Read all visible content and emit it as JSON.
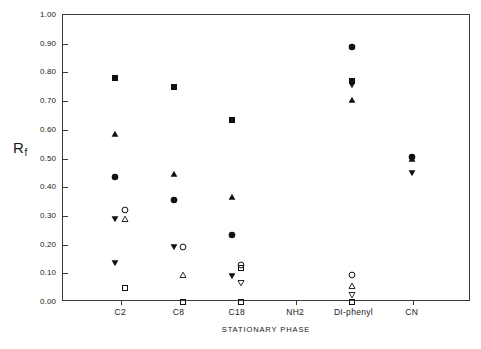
{
  "chart_data": {
    "type": "scatter",
    "title": "",
    "xlabel": "STATIONARY PHASE",
    "ylabel": "Rf",
    "ylabel_base": "R",
    "ylabel_sub": "f",
    "categories": [
      "C2",
      "C8",
      "C18",
      "NH2",
      "DI-phenyl",
      "CN"
    ],
    "ylim": [
      0.0,
      1.0
    ],
    "yticks": [
      "0.00",
      "0.10",
      "0.20",
      "0.30",
      "0.40",
      "0.50",
      "0.60",
      "0.70",
      "0.80",
      "0.90",
      "1.00"
    ],
    "ytick_values": [
      0.0,
      0.1,
      0.2,
      0.3,
      0.4,
      0.5,
      0.6,
      0.7,
      0.8,
      0.9,
      1.0
    ],
    "grid": false,
    "legend": "none",
    "marker_color": "#111111",
    "axis_color": "#3a3a3a",
    "series": [
      {
        "name": "filled-square",
        "marker": "filled-square",
        "points": [
          {
            "category": "C2",
            "offset": -0.1,
            "value": 0.78
          },
          {
            "category": "C8",
            "offset": -0.1,
            "value": 0.75
          },
          {
            "category": "C18",
            "offset": -0.1,
            "value": 0.635
          },
          {
            "category": "DI-phenyl",
            "offset": -0.04,
            "value": 0.77
          }
        ]
      },
      {
        "name": "filled-up-triangle",
        "marker": "filled-up-triangle",
        "points": [
          {
            "category": "C2",
            "offset": -0.1,
            "value": 0.585
          },
          {
            "category": "C8",
            "offset": -0.1,
            "value": 0.445
          },
          {
            "category": "C18",
            "offset": -0.1,
            "value": 0.365
          },
          {
            "category": "DI-phenyl",
            "offset": -0.04,
            "value": 0.705
          },
          {
            "category": "CN",
            "offset": -0.02,
            "value": 0.5
          }
        ]
      },
      {
        "name": "filled-circle",
        "marker": "filled-circle",
        "points": [
          {
            "category": "C2",
            "offset": -0.1,
            "value": 0.435
          },
          {
            "category": "C8",
            "offset": -0.1,
            "value": 0.355
          },
          {
            "category": "C18",
            "offset": -0.1,
            "value": 0.235
          },
          {
            "category": "DI-phenyl",
            "offset": -0.04,
            "value": 0.89
          },
          {
            "category": "CN",
            "offset": -0.02,
            "value": 0.505
          }
        ]
      },
      {
        "name": "filled-down-triangle",
        "marker": "filled-down-triangle",
        "points": [
          {
            "category": "C2",
            "offset": -0.1,
            "value": 0.29
          },
          {
            "category": "C2",
            "offset": -0.1,
            "value": 0.135
          },
          {
            "category": "C8",
            "offset": -0.1,
            "value": 0.19
          },
          {
            "category": "C18",
            "offset": -0.1,
            "value": 0.09
          },
          {
            "category": "DI-phenyl",
            "offset": -0.04,
            "value": 0.755
          },
          {
            "category": "CN",
            "offset": -0.02,
            "value": 0.45
          }
        ]
      },
      {
        "name": "open-circle",
        "marker": "open-circle",
        "points": [
          {
            "category": "C2",
            "offset": 0.06,
            "value": 0.32
          },
          {
            "category": "C8",
            "offset": 0.06,
            "value": 0.19
          },
          {
            "category": "C18",
            "offset": 0.06,
            "value": 0.13
          },
          {
            "category": "DI-phenyl",
            "offset": -0.04,
            "value": 0.095
          }
        ]
      },
      {
        "name": "open-up-triangle",
        "marker": "open-up-triangle",
        "points": [
          {
            "category": "C2",
            "offset": 0.06,
            "value": 0.29
          },
          {
            "category": "C8",
            "offset": 0.06,
            "value": 0.095
          },
          {
            "category": "DI-phenyl",
            "offset": -0.04,
            "value": 0.055
          }
        ]
      },
      {
        "name": "open-down-triangle",
        "marker": "open-down-triangle",
        "points": [
          {
            "category": "C18",
            "offset": 0.06,
            "value": 0.065
          },
          {
            "category": "DI-phenyl",
            "offset": -0.04,
            "value": 0.025
          }
        ]
      },
      {
        "name": "open-square",
        "marker": "open-square",
        "points": [
          {
            "category": "C2",
            "offset": 0.06,
            "value": 0.05
          },
          {
            "category": "C8",
            "offset": 0.06,
            "value": 0.0
          },
          {
            "category": "C18",
            "offset": 0.06,
            "value": 0.12
          },
          {
            "category": "C18",
            "offset": 0.06,
            "value": 0.0
          },
          {
            "category": "DI-phenyl",
            "offset": -0.04,
            "value": 0.0
          }
        ]
      }
    ]
  }
}
